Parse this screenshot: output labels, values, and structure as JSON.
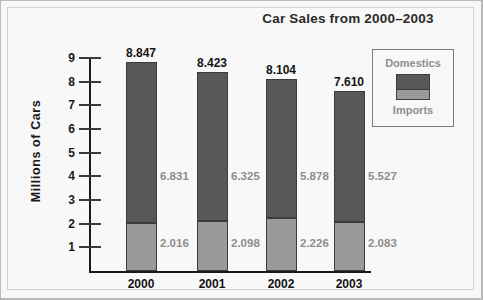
{
  "chart_data": {
    "type": "bar",
    "subtype": "stacked-bar",
    "title": "Car Sales from 2000–2003",
    "xlabel": "",
    "ylabel": "Millions of Cars",
    "ylim": [
      0,
      9
    ],
    "yticks": [
      9,
      8,
      7,
      6,
      5,
      4,
      3,
      2,
      1
    ],
    "grid": false,
    "legend_position": "upper-right",
    "categories": [
      "2000",
      "2001",
      "2002",
      "2003"
    ],
    "series": [
      {
        "name": "Imports",
        "color": "#9a9a9a",
        "values": [
          2.016,
          2.098,
          2.226,
          2.083
        ],
        "labels": [
          "2.016",
          "2.098",
          "2.226",
          "2.083"
        ]
      },
      {
        "name": "Domestics",
        "color": "#585858",
        "values": [
          6.831,
          6.325,
          5.878,
          5.527
        ],
        "labels": [
          "6.831",
          "6.325",
          "5.878",
          "5.527"
        ]
      }
    ],
    "totals": [
      8.847,
      8.423,
      8.104,
      7.61
    ],
    "total_labels": [
      "8.847",
      "8.423",
      "8.104",
      "7.610"
    ]
  },
  "legend": {
    "top_label": "Domestics",
    "bottom_label": "Imports"
  },
  "colors": {
    "domestics": "#585858",
    "imports": "#9a9a9a",
    "axis": "#1a1a1a",
    "value_text": "#8e8e8e",
    "background": "#f8f8f8"
  }
}
